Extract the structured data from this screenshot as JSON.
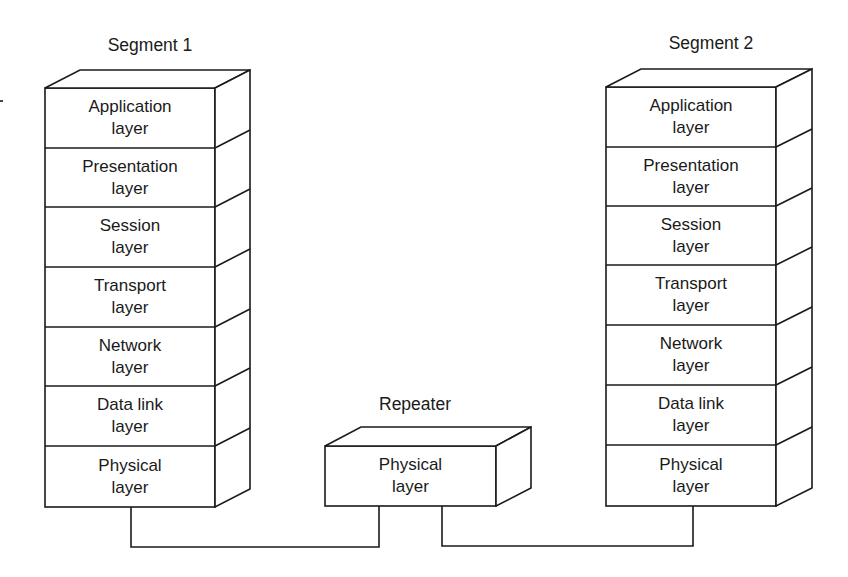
{
  "diagram": {
    "stacks": {
      "segment1": {
        "title": "Segment 1",
        "layers": [
          {
            "line1": "Application",
            "line2": "layer"
          },
          {
            "line1": "Presentation",
            "line2": "layer"
          },
          {
            "line1": "Session",
            "line2": "layer"
          },
          {
            "line1": "Transport",
            "line2": "layer"
          },
          {
            "line1": "Network",
            "line2": "layer"
          },
          {
            "line1": "Data link",
            "line2": "layer"
          },
          {
            "line1": "Physical",
            "line2": "layer"
          }
        ]
      },
      "segment2": {
        "title": "Segment 2",
        "layers": [
          {
            "line1": "Application",
            "line2": "layer"
          },
          {
            "line1": "Presentation",
            "line2": "layer"
          },
          {
            "line1": "Session",
            "line2": "layer"
          },
          {
            "line1": "Transport",
            "line2": "layer"
          },
          {
            "line1": "Network",
            "line2": "layer"
          },
          {
            "line1": "Data link",
            "line2": "layer"
          },
          {
            "line1": "Physical",
            "line2": "layer"
          }
        ]
      },
      "repeater": {
        "title": "Repeater",
        "layers": [
          {
            "line1": "Physical",
            "line2": "layer"
          }
        ]
      }
    },
    "connections": [
      {
        "from": "Segment 1 Physical layer",
        "to": "Repeater Physical layer"
      },
      {
        "from": "Repeater Physical layer",
        "to": "Segment 2 Physical layer"
      }
    ],
    "colors": {
      "stroke": "#1a1a1a",
      "fill": "#ffffff"
    }
  }
}
